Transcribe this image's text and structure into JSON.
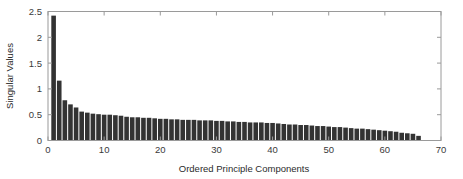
{
  "chart_data": {
    "type": "bar",
    "title": "",
    "subtitle": "",
    "xlabel": "Ordered Principle Components",
    "ylabel": "Singular Values",
    "xlim": [
      0,
      70
    ],
    "ylim": [
      0,
      2.5
    ],
    "xticks": [
      0,
      10,
      20,
      30,
      40,
      50,
      60,
      70
    ],
    "xtick_labels": [
      "0",
      "10",
      "20",
      "30",
      "40",
      "50",
      "60",
      "70"
    ],
    "yticks": [
      0,
      0.5,
      1,
      1.5,
      2,
      2.5
    ],
    "ytick_labels": [
      "0",
      "0.5",
      "1",
      "1.5",
      "2",
      "2.5"
    ],
    "grid": false,
    "legend": false,
    "bar_color": "#333333",
    "axis_color": "#9a9a9a",
    "background_color": "#ffffff",
    "bar_width_units": 0.82,
    "categories": [
      1,
      2,
      3,
      4,
      5,
      6,
      7,
      8,
      9,
      10,
      11,
      12,
      13,
      14,
      15,
      16,
      17,
      18,
      19,
      20,
      21,
      22,
      23,
      24,
      25,
      26,
      27,
      28,
      29,
      30,
      31,
      32,
      33,
      34,
      35,
      36,
      37,
      38,
      39,
      40,
      41,
      42,
      43,
      44,
      45,
      46,
      47,
      48,
      49,
      50,
      51,
      52,
      53,
      54,
      55,
      56,
      57,
      58,
      59,
      60,
      61,
      62,
      63,
      64,
      65,
      66
    ],
    "values": [
      2.42,
      1.16,
      0.78,
      0.7,
      0.64,
      0.56,
      0.54,
      0.52,
      0.51,
      0.5,
      0.5,
      0.49,
      0.48,
      0.46,
      0.45,
      0.45,
      0.44,
      0.44,
      0.43,
      0.42,
      0.42,
      0.41,
      0.41,
      0.4,
      0.4,
      0.4,
      0.39,
      0.39,
      0.39,
      0.38,
      0.38,
      0.37,
      0.37,
      0.36,
      0.36,
      0.35,
      0.35,
      0.35,
      0.34,
      0.34,
      0.33,
      0.32,
      0.31,
      0.31,
      0.3,
      0.3,
      0.29,
      0.28,
      0.28,
      0.27,
      0.26,
      0.26,
      0.25,
      0.24,
      0.23,
      0.23,
      0.22,
      0.21,
      0.2,
      0.19,
      0.18,
      0.17,
      0.15,
      0.14,
      0.13,
      0.09
    ],
    "series": [
      {
        "name": "Singular Values",
        "values": [
          2.42,
          1.16,
          0.78,
          0.7,
          0.64,
          0.56,
          0.54,
          0.52,
          0.51,
          0.5,
          0.5,
          0.49,
          0.48,
          0.46,
          0.45,
          0.45,
          0.44,
          0.44,
          0.43,
          0.42,
          0.42,
          0.41,
          0.41,
          0.4,
          0.4,
          0.4,
          0.39,
          0.39,
          0.39,
          0.38,
          0.38,
          0.37,
          0.37,
          0.36,
          0.36,
          0.35,
          0.35,
          0.35,
          0.34,
          0.34,
          0.33,
          0.32,
          0.31,
          0.31,
          0.3,
          0.3,
          0.29,
          0.28,
          0.28,
          0.27,
          0.26,
          0.26,
          0.25,
          0.24,
          0.23,
          0.23,
          0.22,
          0.21,
          0.2,
          0.19,
          0.18,
          0.17,
          0.15,
          0.14,
          0.13,
          0.09
        ]
      }
    ]
  }
}
